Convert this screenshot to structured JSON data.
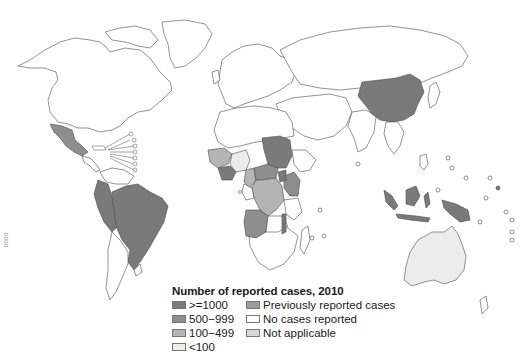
{
  "legend": {
    "title": "Number of reported cases, 2010",
    "items": [
      {
        "label": ">=1000",
        "color": "#7a7a7a"
      },
      {
        "label": "Previously reported cases",
        "color": "#9d9d9d"
      },
      {
        "label": "500−999",
        "color": "#8e8e8e"
      },
      {
        "label": "No cases reported",
        "color": "#ffffff"
      },
      {
        "label": "100−499",
        "color": "#b4b4b4"
      },
      {
        "label": "Not applicable",
        "color": "#d8d8d8"
      },
      {
        "label": "<100",
        "color": "#ececec"
      }
    ]
  },
  "code_mark": "0000",
  "regions": {
    "ge1000": [
      "Brazil",
      "Peru",
      "Colombia",
      "China",
      "Indonesia",
      "DR Congo",
      "Sudan",
      "Cote d'Ivoire",
      "Ghana"
    ],
    "500_999": [
      "Mexico",
      "Angola",
      "Uganda",
      "Tanzania"
    ],
    "100_499": [
      "Nigeria",
      "Cameroon",
      "Gabon",
      "Congo",
      "Central African Republic"
    ],
    "lt100": [
      "Australia"
    ]
  }
}
